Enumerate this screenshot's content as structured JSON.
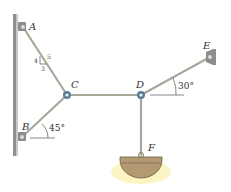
{
  "diagram": {
    "points": {
      "A": "A",
      "B": "B",
      "C": "C",
      "D": "D",
      "E": "E",
      "F": "F"
    },
    "slope": {
      "rise": "4",
      "run": "3",
      "hyp": "5"
    },
    "angles": {
      "B": "45°",
      "E": "30°"
    },
    "colors": {
      "member": "#a8a89a",
      "wall": "#9a9a9a",
      "pin": "#5a7d96",
      "pan": "#b39a72",
      "glow": "#f6e27a"
    }
  }
}
